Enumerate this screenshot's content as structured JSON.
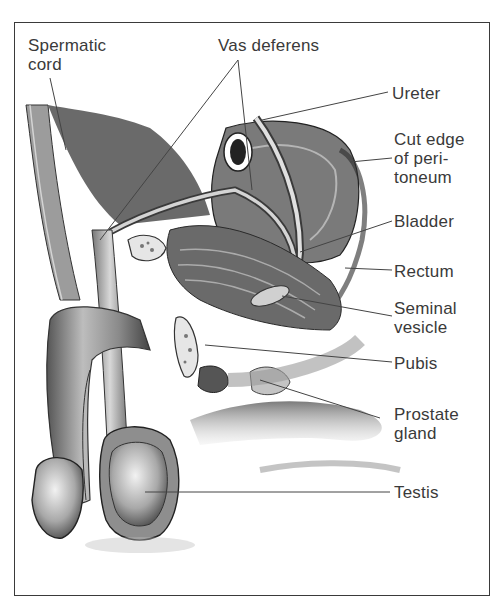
{
  "figure": {
    "type": "anatomical-illustration",
    "style": "grayscale pencil illustration with labeled leader lines"
  },
  "labels": {
    "spermatic_cord": "Spermatic\ncord",
    "vas_deferens": "Vas deferens",
    "ureter": "Ureter",
    "cut_edge_peritoneum": "Cut edge\nof peri-\ntoneum",
    "bladder": "Bladder",
    "rectum": "Rectum",
    "seminal_vesicle": "Seminal\nvesicle",
    "pubis": "Pubis",
    "prostate_gland": "Prostate\ngland",
    "testis": "Testis"
  },
  "colors": {
    "frame": "#3a3a3a",
    "text": "#3a3a3a",
    "leader": "#444444",
    "background": "#ffffff"
  }
}
